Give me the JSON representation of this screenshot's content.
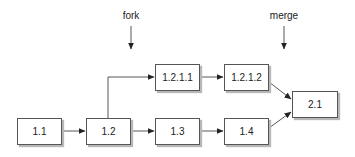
{
  "diagram": {
    "type": "version-branch-graph",
    "annotations": [
      {
        "id": "fork",
        "text": "fork",
        "x": 131,
        "y": 10
      },
      {
        "id": "merge",
        "text": "merge",
        "x": 284,
        "y": 10
      }
    ],
    "nodes": [
      {
        "id": "n11",
        "label": "1.1",
        "x": 17,
        "y": 118,
        "w": 45,
        "h": 27
      },
      {
        "id": "n12",
        "label": "1.2",
        "x": 86,
        "y": 118,
        "w": 45,
        "h": 27
      },
      {
        "id": "n13",
        "label": "1.3",
        "x": 155,
        "y": 118,
        "w": 45,
        "h": 27
      },
      {
        "id": "n14",
        "label": "1.4",
        "x": 224,
        "y": 118,
        "w": 45,
        "h": 27
      },
      {
        "id": "n1211",
        "label": "1.2.1.1",
        "x": 155,
        "y": 64,
        "w": 45,
        "h": 27
      },
      {
        "id": "n1212",
        "label": "1.2.1.2",
        "x": 224,
        "y": 64,
        "w": 45,
        "h": 27
      },
      {
        "id": "n21",
        "label": "2.1",
        "x": 292,
        "y": 91,
        "w": 46,
        "h": 27
      }
    ],
    "edges": [
      {
        "from": "1.1",
        "to": "1.2"
      },
      {
        "from": "1.2",
        "to": "1.3"
      },
      {
        "from": "1.3",
        "to": "1.4"
      },
      {
        "from": "1.2",
        "to": "1.2.1.1"
      },
      {
        "from": "1.2.1.1",
        "to": "1.2.1.2"
      },
      {
        "from": "1.2.1.2",
        "to": "2.1"
      },
      {
        "from": "1.4",
        "to": "2.1"
      }
    ]
  }
}
